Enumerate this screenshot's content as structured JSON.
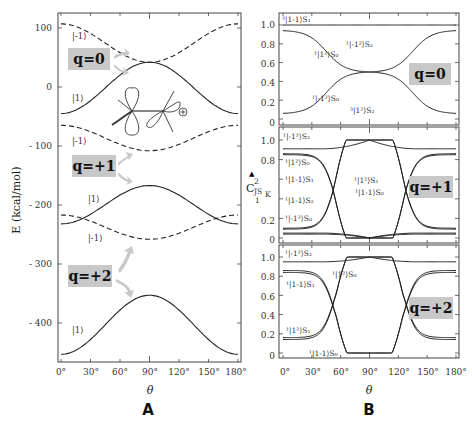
{
  "chart_data": [
    {
      "panel": "A",
      "type": "line",
      "xlabel": "θ",
      "ylabel": "E (kcal/mol)",
      "xlim": [
        0,
        180
      ],
      "ylim": [
        -460,
        120
      ],
      "x_ticks": [
        "0°",
        "30°",
        "60°",
        "90°",
        "120°",
        "150°",
        "180°"
      ],
      "y_ticks": [
        "100",
        "0",
        "- 100",
        "- 200",
        "- 300",
        "- 400"
      ],
      "y_tick_values": [
        100,
        0,
        -100,
        -200,
        -300,
        -400
      ],
      "groups": [
        {
          "q_label": "q=0",
          "series": [
            {
              "name": "|-1⟩",
              "style": "dashed",
              "theta": [
                0,
                90,
                180
              ],
              "E": [
                107,
                42,
                107
              ],
              "shape": "cos2_down"
            },
            {
              "name": "|1⟩",
              "style": "solid",
              "theta": [
                0,
                90,
                180
              ],
              "E": [
                -45,
                42,
                -45
              ],
              "shape": "cos2_up"
            }
          ]
        },
        {
          "q_label": "q=+1",
          "series": [
            {
              "name": "|-1⟩",
              "style": "dashed",
              "theta": [
                0,
                90,
                180
              ],
              "E": [
                -65,
                -108,
                -65
              ],
              "shape": "cos2_down"
            },
            {
              "name": "|1⟩",
              "style": "solid",
              "theta": [
                0,
                90,
                180
              ],
              "E": [
                -232,
                -167,
                -232
              ],
              "shape": "cos2_up"
            },
            {
              "name": "|-1⟩",
              "style": "dashed",
              "theta": [
                0,
                90,
                180
              ],
              "E": [
                -217,
                -258,
                -217
              ],
              "shape": "cos2_down"
            }
          ]
        },
        {
          "q_label": "q=+2",
          "series": [
            {
              "name": "|1⟩",
              "style": "solid",
              "theta": [
                0,
                90,
                180
              ],
              "E": [
                -453,
                -353,
                -453
              ],
              "shape": "cos2_up"
            }
          ]
        }
      ],
      "annotations": [
        "|-1⟩",
        "|1⟩",
        "|-1⟩",
        "|1⟩",
        "|-1⟩",
        "|1⟩",
        "⊕"
      ]
    },
    {
      "panel": "B",
      "type": "line",
      "xlabel": "θ",
      "ylabel": "C²_JS_K",
      "xlim": [
        0,
        180
      ],
      "ylim": [
        0,
        1.1
      ],
      "x_ticks": [
        "0°",
        "30°",
        "60°",
        "90°",
        "120°",
        "150°",
        "180°"
      ],
      "y_ticks": [
        "0",
        "0.2",
        "0.4",
        "0.6",
        "0.8",
        "1.0"
      ],
      "subpanels": [
        {
          "q_label": "q=0",
          "series": [
            {
              "name": "³|1-1⟩S₁",
              "values_at_0": 1.0,
              "values_at_90": 1.0
            },
            {
              "name": "¹|1²⟩S₀ / ¹|-1²⟩S₂",
              "values_at_0": 0.94,
              "values_at_90": 0.5
            },
            {
              "name": "¹|-1²⟩S₀ / ¹|1²⟩S₂",
              "values_at_0": 0.06,
              "values_at_90": 0.5
            }
          ]
        },
        {
          "q_label": "q=+1",
          "series": [
            {
              "name": "¹|-1²⟩S₂",
              "values_at_0": 0.91,
              "values_at_90": 1.0
            },
            {
              "name": "¹|1²⟩S₀",
              "values_at_0": 0.86,
              "values_at_90": 0.0
            },
            {
              "name": "¹|1-1⟩S₁",
              "values_at_0": 0.85,
              "values_at_90": 0.0
            },
            {
              "name": "¹|1²⟩S₁",
              "values_at_0": 0.1,
              "values_at_90": 1.0
            },
            {
              "name": "¹|1-1⟩S₀",
              "values_at_0": 0.09,
              "values_at_90": 1.0
            },
            {
              "name": "¹|1-1⟩S₂",
              "values_at_0": 0.05,
              "values_at_90": 0.0
            },
            {
              "name": "¹|-1²⟩S₀",
              "values_at_0": 0.04,
              "values_at_90": 0.0
            }
          ]
        },
        {
          "q_label": "q=+2",
          "series": [
            {
              "name": "¹|-1²⟩S₂",
              "values_at_0": 0.95,
              "values_at_90": 1.0
            },
            {
              "name": "¹|1²⟩S₀",
              "values_at_0": 0.86,
              "values_at_90": 0.0
            },
            {
              "name": "¹|1-1⟩S₁",
              "values_at_0": 0.84,
              "values_at_90": 0.0
            },
            {
              "name": "¹|1²⟩S₁",
              "values_at_0": 0.16,
              "values_at_90": 1.0
            },
            {
              "name": "¹|1-1⟩S₀",
              "values_at_0": 0.14,
              "values_at_90": 1.0
            }
          ]
        }
      ]
    }
  ],
  "panel_labels": {
    "a": "A",
    "b": "B"
  },
  "axis": {
    "a_ylabel": "E  (kcal/mol)",
    "theta": "θ",
    "b_ylabel_main": "C",
    "b_ylabel_sup": "2",
    "b_ylabel_sub": "JS",
    "b_ylabel_subsub": "K",
    "b_ylabel_index": "1"
  },
  "a_labels": {
    "q0": "q=0",
    "q1": "q=+1",
    "q2": "q=+2",
    "m1_top": "|-1⟩",
    "p1_top": "|1⟩",
    "m1_mid": "|-1⟩",
    "p1_mid": "|1⟩",
    "m1_low": "|-1⟩",
    "p1_low": "|1⟩",
    "plus": "⊕"
  },
  "b_labels": {
    "q0": "q=0",
    "q1": "q=+1",
    "q2": "q=+2",
    "p0_a": "³|1-1⟩S₁",
    "p0_b": "¹|-1²⟩S₂",
    "p0_c": "¹|1²⟩S₀",
    "p0_d": "¹|-1²⟩S₀",
    "p0_e": "³|1²⟩S₂",
    "p1_a": "¹|-1²⟩S₂",
    "p1_b": "¹|1²⟩S₀",
    "p1_c": "¹|1-1⟩S₁",
    "p1_d": "¹|1-1⟩S₂",
    "p1_e": "¹|-1²⟩S₀",
    "p1_f": "¹|1²⟩S₁",
    "p1_g": "¹|1-1⟩S₀",
    "p2_a": "¹|-1²⟩S₂",
    "p2_b": "¹|1²⟩S₀",
    "p2_c": "¹|1-1⟩S₁",
    "p2_d": "¹|1²⟩S₁",
    "p2_e": "¹|1-1⟩S₀"
  }
}
